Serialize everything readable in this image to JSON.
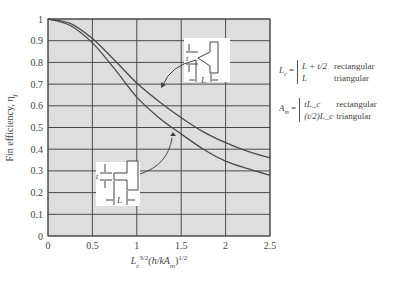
{
  "chart_data": {
    "type": "line",
    "title": "",
    "xlabel": "L_c^{3/2}(h/kA_m)^{1/2}",
    "xlabel_parts": {
      "base": "L",
      "sub1": "c",
      "sup1": "3/2",
      "mid": "(h/kA",
      "sub2": "m",
      "end": ")",
      "sup2": "1/2"
    },
    "ylabel": "Fin efficiency, η",
    "ylabel_sub": "f",
    "xlim": [
      0,
      2.5
    ],
    "ylim": [
      0,
      1
    ],
    "xticks": [
      0,
      0.5,
      1,
      1.5,
      2,
      2.5
    ],
    "xtick_labels": [
      "0",
      "0.5",
      "1",
      "1.5",
      "2",
      "2.5"
    ],
    "yticks": [
      0,
      0.1,
      0.2,
      0.3,
      0.4,
      0.5,
      0.6,
      0.7,
      0.8,
      0.9,
      1
    ],
    "ytick_labels": [
      "0",
      "0.1",
      "0.2",
      "0.3",
      "0.4",
      "0.5",
      "0.6",
      "0.7",
      "0.8",
      "0.9",
      "1"
    ],
    "grid": true,
    "x": [
      0,
      0.25,
      0.5,
      0.75,
      1.0,
      1.25,
      1.5,
      1.75,
      2.0,
      2.25,
      2.5
    ],
    "series": [
      {
        "name": "triangular",
        "values": [
          1.0,
          0.98,
          0.91,
          0.81,
          0.705,
          0.62,
          0.545,
          0.48,
          0.43,
          0.39,
          0.36
        ]
      },
      {
        "name": "rectangular",
        "values": [
          1.0,
          0.97,
          0.89,
          0.77,
          0.64,
          0.545,
          0.47,
          0.4,
          0.345,
          0.31,
          0.28
        ]
      }
    ],
    "annotations": [
      {
        "type": "inset",
        "shape": "triangular fin",
        "labels": [
          "t",
          "L"
        ],
        "points_to": "triangular"
      },
      {
        "type": "inset",
        "shape": "rectangular fin",
        "labels": [
          "t",
          "L"
        ],
        "points_to": "rectangular"
      }
    ]
  },
  "colors": {
    "plot_bg": "#dedede",
    "grid": "#4a4a4a",
    "curve": "#4a4a4a"
  },
  "legend": {
    "lc": {
      "lhs": "L",
      "lhs_sub": "c",
      "eq": " =",
      "cases": [
        {
          "expr": "L + t/2",
          "kind": "rectangular"
        },
        {
          "expr": "L",
          "kind": "triangular"
        }
      ]
    },
    "am": {
      "lhs": "A",
      "lhs_sub": "m",
      "eq": " =",
      "cases": [
        {
          "expr": "tL_c",
          "kind": "rectangular"
        },
        {
          "expr": "(t/2)L_c",
          "kind": "triangular"
        }
      ]
    }
  },
  "insets": {
    "t_label": "t",
    "l_label": "L"
  }
}
